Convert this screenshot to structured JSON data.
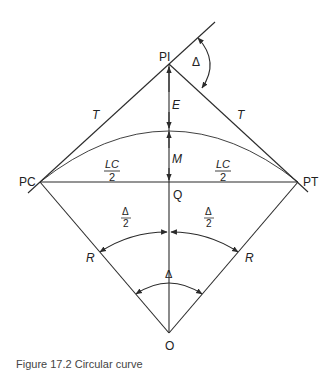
{
  "diagram": {
    "points": {
      "PI": "PI",
      "PC": "PC",
      "PT": "PT",
      "Q": "Q",
      "O": "O"
    },
    "labels": {
      "tangent_left": "T",
      "tangent_right": "T",
      "external": "E",
      "middle_ordinate": "M",
      "half_chord_num": "LC",
      "half_chord_den": "2",
      "radius_left": "R",
      "radius_right": "R",
      "delta": "Δ",
      "half_delta_num": "Δ",
      "half_delta_den": "2"
    },
    "colors": {
      "line": "#2b2b2b",
      "background": "#ffffff"
    }
  },
  "caption": "Figure 17.2 Circular curve"
}
